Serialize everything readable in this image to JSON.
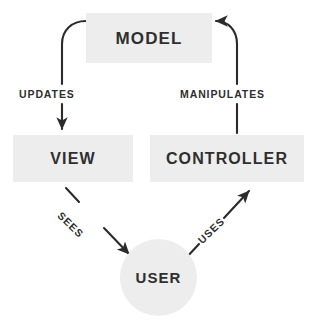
{
  "diagram": {
    "type": "flow-diagram",
    "background_color": "#ffffff",
    "node_fill_color": "#ededed",
    "text_color": "#2f2f2f",
    "stroke_color": "#2b2b2b",
    "nodes": [
      {
        "id": "model",
        "label": "MODEL",
        "shape": "rectangle"
      },
      {
        "id": "view",
        "label": "VIEW",
        "shape": "rectangle"
      },
      {
        "id": "controller",
        "label": "CONTROLLER",
        "shape": "rectangle"
      },
      {
        "id": "user",
        "label": "USER",
        "shape": "circle"
      }
    ],
    "edges": [
      {
        "id": "updates",
        "label": "UPDATES",
        "from": "model",
        "to": "view",
        "style": "curved",
        "direction": "down"
      },
      {
        "id": "manipulates",
        "label": "MANIPULATES",
        "from": "controller",
        "to": "model",
        "style": "curved",
        "direction": "up"
      },
      {
        "id": "sees",
        "label": "SEES",
        "from": "view",
        "to": "user",
        "style": "straight",
        "direction": "down-right"
      },
      {
        "id": "uses",
        "label": "USES",
        "from": "user",
        "to": "controller",
        "style": "straight",
        "direction": "up-right"
      }
    ]
  }
}
